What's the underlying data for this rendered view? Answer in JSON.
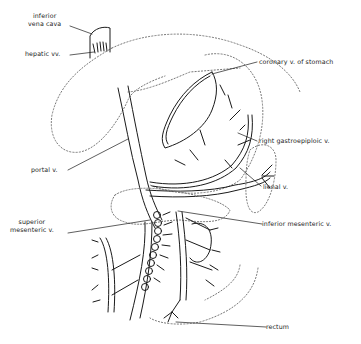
{
  "diagram": {
    "labels": {
      "ivc_line1": "inferior",
      "ivc_line2": "vena cava",
      "hepatic": "hepatic vv.",
      "coronary": "coronary v. of stomach",
      "right_gastroepiploic": "right gastroepiploic v.",
      "portal": "portal v.",
      "lienal": "lienal v.",
      "sup_mes_line1": "superior",
      "sup_mes_line2": "mesenteric v.",
      "inf_mes": "inferior mesenteric v.",
      "rectum": "rectum"
    },
    "colors": {
      "ink": "#1a1a1a",
      "dotted": "#777777",
      "background": "#ffffff"
    }
  }
}
